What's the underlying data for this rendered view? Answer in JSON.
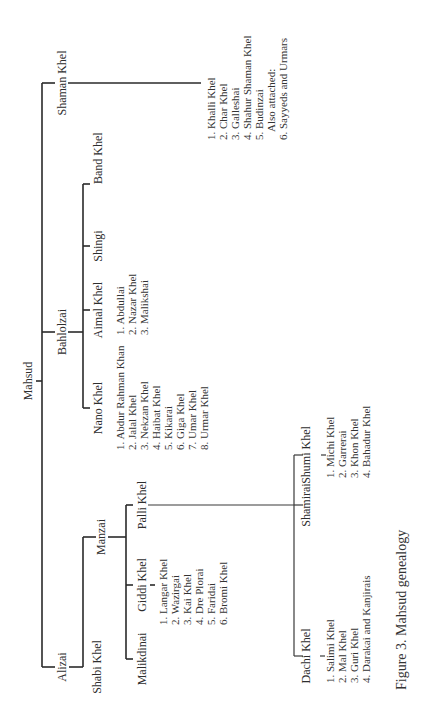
{
  "figure": {
    "caption": "Figure 3.  Mahsud genealogy",
    "orientation": "rotated 90° counter-clockwise"
  },
  "root": {
    "label": "Mahsud"
  },
  "branches": {
    "shaman_khel": {
      "label": "Shaman Khel",
      "items": [
        "1. Khalli Khel",
        "2. Char Khel",
        "3. Galleshai",
        "4. Shahur Shaman Khel",
        "5. Budinzai",
        "Also attached:",
        "6. Sayyeds and Urmars"
      ]
    },
    "bahlolzai": {
      "label": "Bahlolzai",
      "children": {
        "band_khel": {
          "label": "Band Khel"
        },
        "shingi": {
          "label": "Shingi"
        },
        "aimal_khel": {
          "label": "Aimal Khel",
          "items": [
            "1. Abdullai",
            "2. Nazar Khel",
            "3. Malikshai"
          ]
        },
        "nano_khel": {
          "label": "Nano Khel",
          "items": [
            "1. Abdur Rahman Khan",
            "2. Jalal Khel",
            "3. Nekzan Khel",
            "4. Haibat Khel",
            "5. Kikarai",
            "6. Giga Khel",
            "7. Umar Khel",
            "8. Urmar Khel"
          ]
        }
      }
    },
    "alizai": {
      "label": "Alizai",
      "children": {
        "shabi_khel": {
          "label": "Shabi Khel"
        },
        "manzai": {
          "label": "Manzai",
          "children": {
            "palli_khel": {
              "label": "Palli Khel",
              "children": {
                "shamirai": {
                  "label": "Shamirai",
                  "children": {
                    "shumi_khel": {
                      "label": "Shumi Khel",
                      "items": [
                        "1. Michi Khel",
                        "2. Garrerai",
                        "3. Khon Khel",
                        "4. Bahadur Khel"
                      ]
                    },
                    "dachi_khel": {
                      "label": "Dachi Khel",
                      "items": [
                        "1. Salimi Khel",
                        "2. Mal Khel",
                        "3. Guri Khel",
                        "4. Darakai and Kanjirais"
                      ]
                    }
                  }
                }
              }
            },
            "giddi_khel": {
              "label": "Giddi Khel",
              "items": [
                "1. Langar Khel",
                "2. Wazirgai",
                "3. Kai Khel",
                "4. Dre Plorai",
                "5. Faridai",
                "6. Bromi Khel"
              ]
            },
            "malikdinai": {
              "label": "Malikdinai"
            }
          }
        }
      }
    }
  }
}
